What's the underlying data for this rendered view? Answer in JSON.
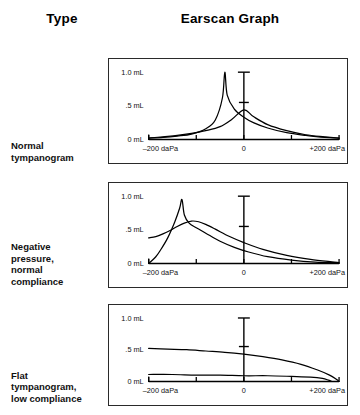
{
  "header": {
    "type_label": "Type",
    "graph_label": "Earscan Graph"
  },
  "axis": {
    "y_labels": [
      "1.0 mL",
      ".5 mL",
      "0 mL"
    ],
    "x_labels": [
      "–200 daPa",
      "0",
      "+200 daPa"
    ],
    "x_tick_values": [
      -200,
      -100,
      0,
      100,
      200
    ],
    "y_tick_values": [
      0,
      0.5,
      1.0
    ],
    "x_unit": "daPa",
    "y_unit": "mL"
  },
  "rows": [
    {
      "label": "Normal\ntympanogram"
    },
    {
      "label": "Negative\npressure,\nnormal\ncompliance"
    },
    {
      "label": "Flat\ntympanogram,\nlow compliance"
    }
  ],
  "colors": {
    "ink": "#111111",
    "panel_border": "#2a2a2a",
    "background": "#ffffff",
    "curve": "#000000"
  },
  "chart_data": [
    {
      "type": "line",
      "title": "Normal tympanogram",
      "xlabel": "daPa",
      "ylabel": "mL",
      "xlim": [
        -200,
        200
      ],
      "ylim": [
        0,
        1.05
      ],
      "grid": false,
      "legend": "none",
      "annotations": [
        {
          "name": "normative-marker",
          "kind": "vertical-range-bar",
          "x": 0,
          "y_bottom": 0.0,
          "y_top": 1.0,
          "mid_tick": 0.55
        }
      ],
      "series": [
        {
          "name": "sharp-peak-curve",
          "x": [
            -200,
            -170,
            -140,
            -110,
            -80,
            -60,
            -45,
            -40,
            -35,
            -20,
            0,
            20,
            50,
            90,
            130,
            170,
            200
          ],
          "values": [
            0.02,
            0.03,
            0.05,
            0.08,
            0.16,
            0.29,
            0.62,
            1.0,
            0.66,
            0.45,
            0.33,
            0.25,
            0.17,
            0.1,
            0.06,
            0.03,
            0.02
          ]
        },
        {
          "name": "broad-peak-curve",
          "x": [
            -200,
            -170,
            -140,
            -110,
            -80,
            -50,
            -25,
            0,
            20,
            50,
            90,
            130,
            170,
            200
          ],
          "values": [
            0.02,
            0.04,
            0.06,
            0.09,
            0.13,
            0.19,
            0.3,
            0.44,
            0.34,
            0.22,
            0.13,
            0.07,
            0.04,
            0.02
          ]
        }
      ]
    },
    {
      "type": "line",
      "title": "Negative pressure, normal compliance",
      "xlabel": "daPa",
      "ylabel": "mL",
      "xlim": [
        -200,
        200
      ],
      "ylim": [
        0,
        1.05
      ],
      "grid": false,
      "legend": "none",
      "annotations": [
        {
          "name": "normative-marker",
          "kind": "vertical-range-bar",
          "x": 0,
          "y_bottom": 0.0,
          "y_top": 1.0,
          "mid_tick": 0.55
        }
      ],
      "series": [
        {
          "name": "sharp-peak-curve",
          "x": [
            -200,
            -185,
            -175,
            -160,
            -145,
            -135,
            -130,
            -125,
            -115,
            -100,
            -80,
            -50,
            -20,
            10,
            50,
            100,
            150,
            200
          ],
          "values": [
            0.0,
            0.1,
            0.2,
            0.38,
            0.62,
            0.82,
            0.95,
            0.72,
            0.6,
            0.53,
            0.45,
            0.33,
            0.24,
            0.17,
            0.1,
            0.05,
            0.02,
            0.01
          ]
        },
        {
          "name": "broad-rounded-curve",
          "x": [
            -200,
            -185,
            -170,
            -155,
            -140,
            -125,
            -110,
            -95,
            -80,
            -60,
            -30,
            0,
            40,
            90,
            140,
            190,
            200
          ],
          "values": [
            0.38,
            0.4,
            0.44,
            0.49,
            0.55,
            0.6,
            0.63,
            0.62,
            0.58,
            0.51,
            0.4,
            0.31,
            0.21,
            0.12,
            0.06,
            0.02,
            0.01
          ]
        }
      ]
    },
    {
      "type": "line",
      "title": "Flat tympanogram, low compliance",
      "xlabel": "daPa",
      "ylabel": "mL",
      "xlim": [
        -200,
        200
      ],
      "ylim": [
        0,
        1.05
      ],
      "grid": false,
      "legend": "none",
      "annotations": [
        {
          "name": "normative-marker",
          "kind": "vertical-range-bar",
          "x": 0,
          "y_bottom": 0.0,
          "y_top": 1.0,
          "mid_tick": 0.55
        }
      ],
      "series": [
        {
          "name": "upper-flat-curve",
          "x": [
            -200,
            -160,
            -120,
            -80,
            -40,
            0,
            40,
            80,
            120,
            155,
            180,
            195,
            200
          ],
          "values": [
            0.52,
            0.51,
            0.5,
            0.48,
            0.46,
            0.43,
            0.39,
            0.34,
            0.27,
            0.18,
            0.1,
            0.03,
            0.0
          ]
        },
        {
          "name": "lower-flat-curve",
          "x": [
            -200,
            -150,
            -100,
            -50,
            0,
            50,
            100,
            140,
            165,
            178,
            185
          ],
          "values": [
            0.11,
            0.11,
            0.1,
            0.1,
            0.09,
            0.09,
            0.08,
            0.07,
            0.05,
            0.02,
            0.0
          ]
        }
      ]
    }
  ]
}
